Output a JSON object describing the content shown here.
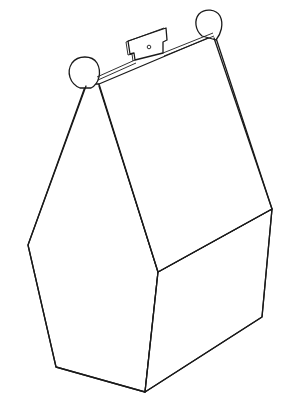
{
  "figure": {
    "title": "",
    "stroke_color": "#1a1a1a",
    "background_color": "#ffffff",
    "parts": [
      {
        "name": "left-ear-flap",
        "shape": "circle"
      },
      {
        "name": "right-ear-flap",
        "shape": "circle"
      },
      {
        "name": "handle-tab",
        "shape": "notched-rectangle",
        "has_hole": true
      },
      {
        "name": "roof-left-panel"
      },
      {
        "name": "roof-right-panel"
      },
      {
        "name": "front-end-panel"
      },
      {
        "name": "side-panel"
      }
    ]
  }
}
